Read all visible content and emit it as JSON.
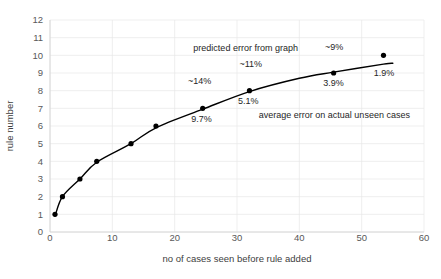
{
  "chart_data": {
    "type": "scatter",
    "title": "",
    "xlabel": "no of cases seen before rule added",
    "ylabel": "rule number",
    "xlim": [
      0,
      60
    ],
    "ylim": [
      0,
      12
    ],
    "grid": true,
    "legend_position": "none",
    "xticks": [
      "0",
      "10",
      "20",
      "30",
      "40",
      "50",
      "60"
    ],
    "yticks": [
      "0",
      "1",
      "2",
      "3",
      "4",
      "5",
      "6",
      "7",
      "8",
      "9",
      "10",
      "11",
      "12"
    ],
    "x": [
      0.8,
      2.0,
      4.8,
      7.5,
      13.0,
      17.0,
      24.5,
      32.0,
      45.5,
      53.5
    ],
    "values": [
      1,
      2,
      3,
      4,
      5,
      6,
      7,
      8,
      9,
      10
    ],
    "series": [
      {
        "name": "rule number vs cases seen",
        "x": [
          0.8,
          2.0,
          4.8,
          7.5,
          13.0,
          17.0,
          24.5,
          32.0,
          45.5,
          53.5
        ],
        "values": [
          1,
          2,
          3,
          4,
          5,
          6,
          7,
          8,
          9,
          10
        ]
      }
    ],
    "fit_curve": {
      "name": "smoothed trend line",
      "x": [
        0.8,
        2.0,
        4.8,
        7.5,
        13.0,
        17.0,
        24.5,
        32.0,
        40.0,
        45.5,
        53.5,
        55.0
      ],
      "y": [
        0.9,
        2.0,
        3.0,
        3.95,
        5.0,
        5.9,
        6.95,
        7.95,
        8.7,
        9.05,
        9.5,
        9.55
      ]
    },
    "annotations": [
      {
        "id": "predicted-error-label",
        "text": "predicted error from graph",
        "x": 23.0,
        "y": 10.25,
        "anchor": "start"
      },
      {
        "id": "actual-error-label",
        "text": "average error on actual unseen cases",
        "x": 33.5,
        "y": 6.45,
        "anchor": "start"
      },
      {
        "id": "pred-14",
        "text": "~14%",
        "x": 24.0,
        "y": 8.35,
        "anchor": "middle"
      },
      {
        "id": "pred-11",
        "text": "~11%",
        "x": 32.2,
        "y": 9.35,
        "anchor": "middle"
      },
      {
        "id": "pred-9",
        "text": "~9%",
        "x": 45.6,
        "y": 10.3,
        "anchor": "middle"
      },
      {
        "id": "actual-9-7",
        "text": "9.7%",
        "x": 24.3,
        "y": 6.2,
        "anchor": "middle"
      },
      {
        "id": "actual-5-1",
        "text": "5.1%",
        "x": 31.8,
        "y": 7.25,
        "anchor": "middle"
      },
      {
        "id": "actual-3-9",
        "text": "3.9%",
        "x": 45.5,
        "y": 8.25,
        "anchor": "middle"
      },
      {
        "id": "actual-1-9",
        "text": "1.9%",
        "x": 53.6,
        "y": 8.85,
        "anchor": "middle"
      }
    ],
    "colors": {
      "marker": "#000000",
      "line": "#000000",
      "grid": "#e8e8e8",
      "axis": "#d0d0d0",
      "tick_text": "#595959",
      "axis_title": "#404040",
      "annotation_text": "#262626",
      "background": "#ffffff"
    }
  }
}
